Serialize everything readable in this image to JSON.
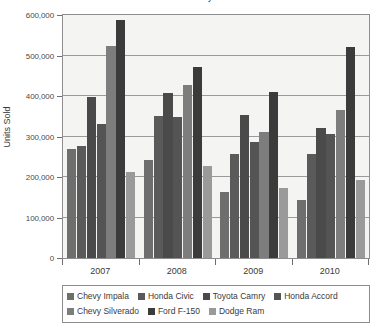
{
  "chart_data": {
    "type": "bar",
    "title": "Vehicle Sales by Model",
    "xlabel": "",
    "ylabel": "Units Sold",
    "ylim": [
      0,
      600000
    ],
    "ytick_labels": [
      "0",
      "100,000",
      "200,000",
      "300,000",
      "400,000",
      "500,000",
      "600,000"
    ],
    "ytick_values": [
      0,
      100000,
      200000,
      300000,
      400000,
      500000,
      600000
    ],
    "grid": true,
    "legend_position": "bottom",
    "categories": [
      "2007",
      "2008",
      "2009",
      "2010"
    ],
    "series": [
      {
        "name": "Chevy Impala",
        "color": "#6e6e6e",
        "values": [
          270000,
          242000,
          163000,
          143000
        ]
      },
      {
        "name": "Honda Civic",
        "color": "#5a5a5a",
        "values": [
          277000,
          350000,
          256000,
          256000
        ]
      },
      {
        "name": "Toyota Camry",
        "color": "#4a4a4a",
        "values": [
          398000,
          407000,
          354000,
          322000
        ]
      },
      {
        "name": "Honda Accord",
        "color": "#545454",
        "values": [
          332000,
          348000,
          286000,
          306000
        ]
      },
      {
        "name": "Chevy Silverado",
        "color": "#7d7d7d",
        "values": [
          524000,
          428000,
          312000,
          365000
        ]
      },
      {
        "name": "Ford F-150",
        "color": "#3b3b3b",
        "values": [
          588000,
          471000,
          410000,
          522000
        ]
      },
      {
        "name": "Dodge Ram",
        "color": "#9a9a9a",
        "values": [
          212000,
          226000,
          173000,
          193000
        ]
      }
    ]
  },
  "axis": {
    "y_title": "Units Sold"
  },
  "colors": {
    "plot_background": "#f4f4f2",
    "frame": "#8d8d8d",
    "gridline": "#9a9a9a",
    "text": "#3a3a3a"
  }
}
